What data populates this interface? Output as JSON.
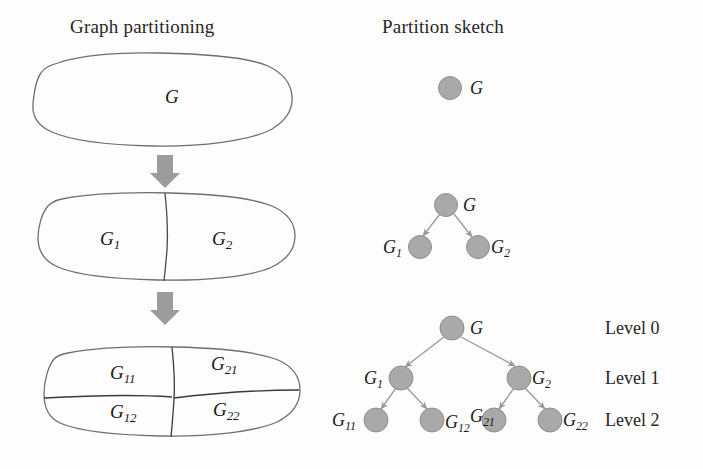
{
  "figure": {
    "columns": {
      "left_title": "Graph partitioning",
      "right_title": "Partition sketch"
    },
    "colors": {
      "node_fill": "#a9a9a9",
      "node_stroke": "#8f8f8f",
      "edge": "#9a9a9a",
      "blob_stroke": "#6e6e6e",
      "arrow": "#9c9c9c",
      "text": "#1a1a1a",
      "background": "#fdfdfd"
    },
    "stages": [
      {
        "name": "stage-0-whole-graph",
        "blob_labels": [
          {
            "base": "G",
            "sub": ""
          }
        ],
        "tree_nodes": [
          {
            "id": "G",
            "base": "G",
            "sub": "",
            "level": 0
          }
        ],
        "level_labels": []
      },
      {
        "name": "stage-1-bisection",
        "blob_labels": [
          {
            "base": "G",
            "sub": "1"
          },
          {
            "base": "G",
            "sub": "2"
          }
        ],
        "tree_nodes": [
          {
            "id": "G",
            "base": "G",
            "sub": "",
            "level": 0
          },
          {
            "id": "G1",
            "base": "G",
            "sub": "1",
            "level": 1
          },
          {
            "id": "G2",
            "base": "G",
            "sub": "2",
            "level": 1
          }
        ],
        "level_labels": []
      },
      {
        "name": "stage-2-quadrisection",
        "blob_labels": [
          {
            "base": "G",
            "sub": "11"
          },
          {
            "base": "G",
            "sub": "21"
          },
          {
            "base": "G",
            "sub": "12"
          },
          {
            "base": "G",
            "sub": "22"
          }
        ],
        "tree_nodes": [
          {
            "id": "G",
            "base": "G",
            "sub": "",
            "level": 0
          },
          {
            "id": "G1",
            "base": "G",
            "sub": "1",
            "level": 1
          },
          {
            "id": "G2",
            "base": "G",
            "sub": "2",
            "level": 1
          },
          {
            "id": "G11",
            "base": "G",
            "sub": "11",
            "level": 2
          },
          {
            "id": "G12",
            "base": "G",
            "sub": "12",
            "level": 2
          },
          {
            "id": "G21",
            "base": "G",
            "sub": "21",
            "level": 2
          },
          {
            "id": "G22",
            "base": "G",
            "sub": "22",
            "level": 2
          }
        ],
        "level_labels": [
          "Level 0",
          "Level 1",
          "Level 2"
        ]
      }
    ],
    "arrows": [
      {
        "name": "down-arrow-1",
        "from_stage": 0,
        "to_stage": 1
      },
      {
        "name": "down-arrow-2",
        "from_stage": 1,
        "to_stage": 2
      }
    ],
    "text": {
      "G": "G",
      "G1_base": "G",
      "G1_sub": "1",
      "G2_base": "G",
      "G2_sub": "2",
      "G11_base": "G",
      "G11_sub": "11",
      "G12_base": "G",
      "G12_sub": "12",
      "G21_base": "G",
      "G21_sub": "21",
      "G22_base": "G",
      "G22_sub": "22",
      "level0": "Level 0",
      "level1": "Level 1",
      "level2": "Level 2"
    }
  }
}
